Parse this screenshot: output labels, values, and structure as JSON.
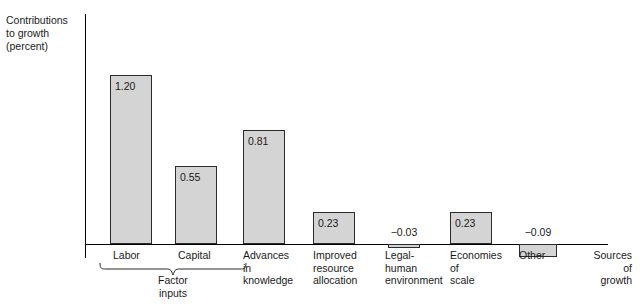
{
  "chart_data": {
    "type": "bar",
    "title": "",
    "ylabel": "Contributions\nto growth\n(percent)",
    "xlabel": "Sources\nof\ngrowth",
    "categories": [
      "Labor",
      "Capital",
      "Advances\nin\nknowledge",
      "Improved\nresource\nallocation",
      "Legal-\nhuman\nenvironment",
      "Economies\nof\nscale",
      "Other"
    ],
    "values": [
      1.2,
      0.55,
      0.81,
      0.23,
      -0.03,
      0.23,
      -0.09
    ],
    "value_labels": [
      "1.20",
      "0.55",
      "0.81",
      "0.23",
      "−0.03",
      "0.23",
      "−0.09"
    ],
    "grid": false,
    "legend": "none",
    "ylim": [
      -0.15,
      1.65
    ],
    "group_brackets": [
      {
        "label": "Factor\ninputs",
        "members": [
          "Labor",
          "Capital"
        ]
      }
    ],
    "bar_fill": "#d4d4d4",
    "bar_border": "#2b2b2b",
    "axis_color": "#000000"
  },
  "geometry": {
    "baseline_y": 244,
    "axis_left_x": 85,
    "unit_px": 141,
    "bars": [
      {
        "x": 110,
        "w": 42
      },
      {
        "x": 175,
        "w": 42
      },
      {
        "x": 243,
        "w": 42
      },
      {
        "x": 313,
        "w": 42
      },
      {
        "x": 388,
        "w": 32
      },
      {
        "x": 450,
        "w": 42
      },
      {
        "x": 519,
        "w": 38
      }
    ],
    "cat_label_x": [
      113,
      178,
      243,
      313,
      385,
      450,
      519
    ],
    "cat_label_y": 249,
    "axis_end_label_x": 578,
    "axis_end_label_y": 249
  }
}
